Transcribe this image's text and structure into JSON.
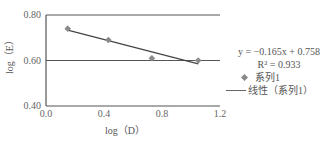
{
  "chart_data": {
    "type": "scatter",
    "title": "",
    "xlabel": "log（D）",
    "ylabel": "log（E）",
    "xlim": [
      0.0,
      1.2
    ],
    "ylim": [
      0.4,
      0.8
    ],
    "x_ticks": [
      "0.0",
      "0.4",
      "0.8",
      "1.2"
    ],
    "y_ticks": [
      "0.40",
      "0.60",
      "0.80"
    ],
    "grid": "horizontal",
    "series": [
      {
        "name": "系列1",
        "marker": "diamond",
        "color": "#8a8a8a",
        "x": [
          0.15,
          0.43,
          0.73,
          1.05
        ],
        "y": [
          0.74,
          0.69,
          0.61,
          0.6
        ]
      }
    ],
    "trendline": {
      "name": "线性（系列1）",
      "slope": -0.165,
      "intercept": 0.758,
      "r2": 0.933,
      "x_range": [
        0.15,
        1.05
      ],
      "color": "#444444"
    },
    "legend_position": "right"
  },
  "legend": {
    "equation": "y = −0.165x + 0.758",
    "r2": "R² = 0.933",
    "series_label": "系列1",
    "trend_label": "线性（系列1）"
  }
}
